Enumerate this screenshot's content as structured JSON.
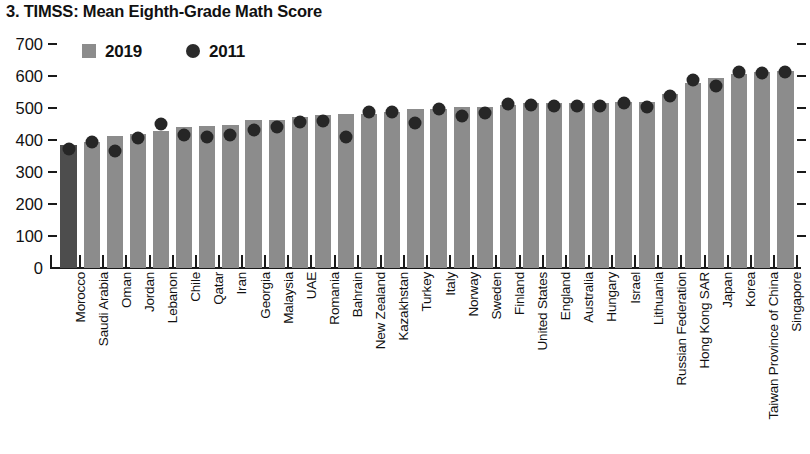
{
  "chart_data": {
    "type": "bar",
    "title": "3. TIMSS: Mean Eighth-Grade Math Score",
    "xlabel": "",
    "ylabel": "",
    "ylim": [
      0,
      700
    ],
    "ytick_step": 100,
    "yticks": [
      0,
      100,
      200,
      300,
      400,
      500,
      600,
      700
    ],
    "grid": false,
    "legend_position": "top-left",
    "legend": [
      {
        "name": "2019",
        "marker": "square",
        "color": "#8c8c8c"
      },
      {
        "name": "2011",
        "marker": "circle",
        "color": "#262626"
      }
    ],
    "highlight_category": "Morocco",
    "highlight_color": "#4d4d4d",
    "bar_color": "#8c8c8c",
    "categories": [
      "Morocco",
      "Saudi Arabia",
      "Oman",
      "Jordan",
      "Lebanon",
      "Chile",
      "Qatar",
      "Iran",
      "Georgia",
      "Malaysia",
      "UAE",
      "Romania",
      "Bahrain",
      "New Zealand",
      "Kazakhstan",
      "Turkey",
      "Italy",
      "Norway",
      "Sweden",
      "Finland",
      "United States",
      "England",
      "Australia",
      "Hungary",
      "Israel",
      "Lithuania",
      "Russian Federation",
      "Hong Kong SAR",
      "Japan",
      "Korea",
      "Taiwan Province of China",
      "Singapore"
    ],
    "series": [
      {
        "name": "2019",
        "marker": "bar",
        "values": [
          383,
          394,
          411,
          420,
          429,
          441,
          443,
          446,
          461,
          461,
          473,
          479,
          481,
          482,
          488,
          496,
          497,
          503,
          503,
          509,
          515,
          515,
          517,
          517,
          519,
          520,
          543,
          578,
          594,
          607,
          612,
          616
        ]
      },
      {
        "name": "2011",
        "marker": "circle",
        "values": [
          371,
          394,
          366,
          406,
          449,
          416,
          410,
          415,
          431,
          440,
          456,
          458,
          409,
          488,
          487,
          452,
          498,
          475,
          484,
          514,
          509,
          507,
          505,
          505,
          516,
          502,
          539,
          586,
          570,
          613,
          609,
          611
        ]
      }
    ]
  }
}
